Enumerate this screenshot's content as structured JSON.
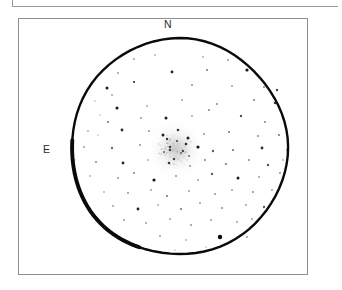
{
  "figure": {
    "kind": "astronomical-eyepiece-sketch",
    "background_color": "#ffffff",
    "ink_color": "#000000",
    "frame": {
      "border_color": "#8e8e8e",
      "top_rule_color": "#9a9a9a"
    }
  },
  "orientation": {
    "north_label": "N",
    "east_label": "E"
  },
  "chart_data": {
    "type": "scatter",
    "title": "",
    "subtitle": "",
    "xlabel": "",
    "ylabel": "",
    "grid": false,
    "legend": null,
    "annotations": [
      "N",
      "E"
    ],
    "field_of_view": {
      "shape": "circle",
      "center_x": 179,
      "center_y": 147,
      "radius": 108,
      "stroke_color": "#0a0a0a",
      "stroke_width": 2.4
    },
    "nebulous_object": {
      "name": "globular-cluster-glow",
      "center_x": 176,
      "center_y": 149,
      "radius": 17,
      "peak_opacity": 0.22,
      "color": "#8d8d8d"
    },
    "stars": [
      {
        "x": 107,
        "y": 88,
        "r": 1.5,
        "o": 0.92
      },
      {
        "x": 134,
        "y": 82,
        "r": 1.1,
        "o": 0.85
      },
      {
        "x": 172,
        "y": 72,
        "r": 1.4,
        "o": 0.9
      },
      {
        "x": 207,
        "y": 70,
        "r": 1.0,
        "o": 0.55
      },
      {
        "x": 247,
        "y": 70,
        "r": 1.6,
        "o": 0.95
      },
      {
        "x": 264,
        "y": 87,
        "r": 1.0,
        "o": 0.5
      },
      {
        "x": 277,
        "y": 90,
        "r": 1.2,
        "o": 0.75
      },
      {
        "x": 112,
        "y": 95,
        "r": 0.9,
        "o": 0.4
      },
      {
        "x": 95,
        "y": 101,
        "r": 0.8,
        "o": 0.33
      },
      {
        "x": 117,
        "y": 108,
        "r": 1.5,
        "o": 0.95
      },
      {
        "x": 147,
        "y": 106,
        "r": 0.9,
        "o": 0.38
      },
      {
        "x": 182,
        "y": 100,
        "r": 0.9,
        "o": 0.4
      },
      {
        "x": 217,
        "y": 104,
        "r": 1.0,
        "o": 0.45
      },
      {
        "x": 254,
        "y": 100,
        "r": 1.0,
        "o": 0.5
      },
      {
        "x": 275,
        "y": 103,
        "r": 1.3,
        "o": 0.8
      },
      {
        "x": 100,
        "y": 115,
        "r": 0.8,
        "o": 0.3
      },
      {
        "x": 108,
        "y": 122,
        "r": 1.1,
        "o": 0.55
      },
      {
        "x": 141,
        "y": 118,
        "r": 1.0,
        "o": 0.45
      },
      {
        "x": 166,
        "y": 118,
        "r": 1.5,
        "o": 0.9
      },
      {
        "x": 192,
        "y": 116,
        "r": 0.9,
        "o": 0.4
      },
      {
        "x": 209,
        "y": 110,
        "r": 1.0,
        "o": 0.5
      },
      {
        "x": 241,
        "y": 116,
        "r": 1.2,
        "o": 0.7
      },
      {
        "x": 265,
        "y": 122,
        "r": 1.0,
        "o": 0.5
      },
      {
        "x": 283,
        "y": 118,
        "r": 1.2,
        "o": 0.7
      },
      {
        "x": 88,
        "y": 131,
        "r": 0.9,
        "o": 0.35
      },
      {
        "x": 122,
        "y": 130,
        "r": 1.4,
        "o": 0.88
      },
      {
        "x": 149,
        "y": 131,
        "r": 1.0,
        "o": 0.45
      },
      {
        "x": 163,
        "y": 135,
        "r": 1.5,
        "o": 0.9
      },
      {
        "x": 178,
        "y": 130,
        "r": 1.3,
        "o": 0.8
      },
      {
        "x": 188,
        "y": 138,
        "r": 1.5,
        "o": 0.92
      },
      {
        "x": 204,
        "y": 134,
        "r": 1.0,
        "o": 0.45
      },
      {
        "x": 229,
        "y": 132,
        "r": 1.1,
        "o": 0.55
      },
      {
        "x": 258,
        "y": 136,
        "r": 1.0,
        "o": 0.45
      },
      {
        "x": 279,
        "y": 135,
        "r": 1.1,
        "o": 0.55
      },
      {
        "x": 84,
        "y": 147,
        "r": 1.0,
        "o": 0.4
      },
      {
        "x": 112,
        "y": 148,
        "r": 1.2,
        "o": 0.6
      },
      {
        "x": 140,
        "y": 145,
        "r": 1.0,
        "o": 0.45
      },
      {
        "x": 170,
        "y": 147,
        "r": 1.3,
        "o": 0.75
      },
      {
        "x": 183,
        "y": 151,
        "r": 1.2,
        "o": 0.7
      },
      {
        "x": 198,
        "y": 147,
        "r": 1.6,
        "o": 0.95
      },
      {
        "x": 213,
        "y": 151,
        "r": 1.2,
        "o": 0.65
      },
      {
        "x": 233,
        "y": 150,
        "r": 1.1,
        "o": 0.55
      },
      {
        "x": 262,
        "y": 148,
        "r": 1.4,
        "o": 0.85
      },
      {
        "x": 287,
        "y": 150,
        "r": 1.0,
        "o": 0.45
      },
      {
        "x": 96,
        "y": 162,
        "r": 1.0,
        "o": 0.45
      },
      {
        "x": 123,
        "y": 163,
        "r": 1.4,
        "o": 0.88
      },
      {
        "x": 148,
        "y": 160,
        "r": 0.9,
        "o": 0.35
      },
      {
        "x": 169,
        "y": 163,
        "r": 1.3,
        "o": 0.8
      },
      {
        "x": 190,
        "y": 166,
        "r": 1.0,
        "o": 0.45
      },
      {
        "x": 205,
        "y": 160,
        "r": 1.0,
        "o": 0.5
      },
      {
        "x": 226,
        "y": 164,
        "r": 1.1,
        "o": 0.55
      },
      {
        "x": 249,
        "y": 160,
        "r": 1.0,
        "o": 0.45
      },
      {
        "x": 268,
        "y": 165,
        "r": 1.2,
        "o": 0.7
      },
      {
        "x": 90,
        "y": 176,
        "r": 0.9,
        "o": 0.35
      },
      {
        "x": 118,
        "y": 178,
        "r": 1.0,
        "o": 0.45
      },
      {
        "x": 134,
        "y": 173,
        "r": 1.0,
        "o": 0.5
      },
      {
        "x": 154,
        "y": 180,
        "r": 1.6,
        "o": 0.95
      },
      {
        "x": 176,
        "y": 176,
        "r": 1.0,
        "o": 0.45
      },
      {
        "x": 198,
        "y": 180,
        "r": 1.0,
        "o": 0.4
      },
      {
        "x": 212,
        "y": 174,
        "r": 1.2,
        "o": 0.65
      },
      {
        "x": 238,
        "y": 178,
        "r": 1.5,
        "o": 0.92
      },
      {
        "x": 259,
        "y": 177,
        "r": 1.0,
        "o": 0.4
      },
      {
        "x": 280,
        "y": 173,
        "r": 1.0,
        "o": 0.45
      },
      {
        "x": 104,
        "y": 192,
        "r": 0.9,
        "o": 0.35
      },
      {
        "x": 128,
        "y": 193,
        "r": 1.0,
        "o": 0.45
      },
      {
        "x": 151,
        "y": 190,
        "r": 1.0,
        "o": 0.4
      },
      {
        "x": 167,
        "y": 196,
        "r": 1.1,
        "o": 0.55
      },
      {
        "x": 189,
        "y": 191,
        "r": 1.0,
        "o": 0.4
      },
      {
        "x": 215,
        "y": 194,
        "r": 1.0,
        "o": 0.45
      },
      {
        "x": 232,
        "y": 190,
        "r": 1.0,
        "o": 0.4
      },
      {
        "x": 253,
        "y": 192,
        "r": 1.0,
        "o": 0.45
      },
      {
        "x": 272,
        "y": 190,
        "r": 1.0,
        "o": 0.4
      },
      {
        "x": 113,
        "y": 206,
        "r": 1.0,
        "o": 0.4
      },
      {
        "x": 138,
        "y": 209,
        "r": 1.4,
        "o": 0.9
      },
      {
        "x": 158,
        "y": 205,
        "r": 0.9,
        "o": 0.35
      },
      {
        "x": 181,
        "y": 209,
        "r": 1.1,
        "o": 0.55
      },
      {
        "x": 200,
        "y": 203,
        "r": 1.0,
        "o": 0.4
      },
      {
        "x": 222,
        "y": 208,
        "r": 1.0,
        "o": 0.45
      },
      {
        "x": 246,
        "y": 205,
        "r": 1.0,
        "o": 0.4
      },
      {
        "x": 264,
        "y": 207,
        "r": 1.2,
        "o": 0.65
      },
      {
        "x": 124,
        "y": 220,
        "r": 1.0,
        "o": 0.4
      },
      {
        "x": 146,
        "y": 223,
        "r": 1.0,
        "o": 0.4
      },
      {
        "x": 170,
        "y": 219,
        "r": 1.0,
        "o": 0.4
      },
      {
        "x": 191,
        "y": 225,
        "r": 1.0,
        "o": 0.45
      },
      {
        "x": 211,
        "y": 220,
        "r": 1.0,
        "o": 0.4
      },
      {
        "x": 220,
        "y": 237,
        "r": 2.2,
        "o": 1.0
      },
      {
        "x": 237,
        "y": 222,
        "r": 1.0,
        "o": 0.4
      },
      {
        "x": 252,
        "y": 219,
        "r": 1.0,
        "o": 0.4
      },
      {
        "x": 160,
        "y": 236,
        "r": 1.0,
        "o": 0.4
      },
      {
        "x": 186,
        "y": 240,
        "r": 0.9,
        "o": 0.35
      },
      {
        "x": 247,
        "y": 237,
        "r": 1.0,
        "o": 0.4
      },
      {
        "x": 134,
        "y": 59,
        "r": 1.0,
        "o": 0.4
      },
      {
        "x": 155,
        "y": 55,
        "r": 0.9,
        "o": 0.33
      },
      {
        "x": 203,
        "y": 57,
        "r": 0.9,
        "o": 0.35
      },
      {
        "x": 228,
        "y": 60,
        "r": 1.0,
        "o": 0.4
      },
      {
        "x": 118,
        "y": 73,
        "r": 1.0,
        "o": 0.4
      },
      {
        "x": 192,
        "y": 85,
        "r": 1.0,
        "o": 0.45
      },
      {
        "x": 232,
        "y": 86,
        "r": 1.0,
        "o": 0.4
      },
      {
        "x": 98,
        "y": 135,
        "r": 0.8,
        "o": 0.3
      },
      {
        "x": 75,
        "y": 160,
        "r": 0.8,
        "o": 0.3
      },
      {
        "x": 283,
        "y": 160,
        "r": 0.9,
        "o": 0.33
      },
      {
        "x": 175,
        "y": 250,
        "r": 0.8,
        "o": 0.3
      },
      {
        "x": 206,
        "y": 247,
        "r": 0.8,
        "o": 0.3
      }
    ],
    "cluster_member_stars": [
      {
        "x": 167,
        "y": 139,
        "r": 1.2,
        "o": 0.8
      },
      {
        "x": 177,
        "y": 141,
        "r": 1.1,
        "o": 0.7
      },
      {
        "x": 186,
        "y": 144,
        "r": 1.3,
        "o": 0.85
      },
      {
        "x": 170,
        "y": 150,
        "r": 1.2,
        "o": 0.75
      },
      {
        "x": 181,
        "y": 153,
        "r": 1.0,
        "o": 0.6
      },
      {
        "x": 174,
        "y": 159,
        "r": 1.2,
        "o": 0.75
      },
      {
        "x": 164,
        "y": 152,
        "r": 1.0,
        "o": 0.55
      },
      {
        "x": 189,
        "y": 156,
        "r": 1.0,
        "o": 0.55
      }
    ]
  }
}
